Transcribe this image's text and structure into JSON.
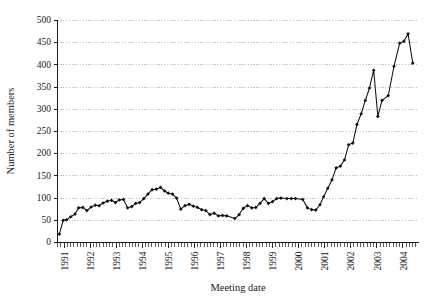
{
  "chart_data": {
    "type": "line",
    "title": "",
    "xlabel": "Meeting date",
    "ylabel": "Number of members",
    "ylim": [
      0,
      500
    ],
    "ytick_step": 50,
    "yticks": [
      0,
      50,
      100,
      150,
      200,
      250,
      300,
      350,
      400,
      450,
      500
    ],
    "xticks": [
      "1991",
      "1992",
      "1993",
      "1994",
      "1995",
      "1996",
      "1997",
      "1998",
      "1999",
      "2000",
      "2001",
      "2002",
      "2003",
      "2004"
    ],
    "xlim": [
      1990.75,
      2004.6
    ],
    "grid": "horizontal",
    "legend": "none",
    "marker": "filled-diamond",
    "line_color": "#111111",
    "marker_color": "#111111",
    "grid_color": "#9a9a9a",
    "series": [
      {
        "name": "Number of members",
        "x": [
          1990.82,
          1990.97,
          1991.1,
          1991.26,
          1991.42,
          1991.56,
          1991.72,
          1991.88,
          1992.04,
          1992.2,
          1992.35,
          1992.5,
          1992.66,
          1992.82,
          1992.97,
          1993.12,
          1993.28,
          1993.44,
          1993.6,
          1993.75,
          1993.9,
          1994.06,
          1994.22,
          1994.38,
          1994.54,
          1994.7,
          1994.86,
          1995.0,
          1995.16,
          1995.32,
          1995.48,
          1995.64,
          1995.8,
          1995.96,
          1996.12,
          1996.28,
          1996.44,
          1996.6,
          1996.76,
          1996.92,
          1997.08,
          1997.24,
          1997.55,
          1997.72,
          1997.88,
          1998.04,
          1998.2,
          1998.36,
          1998.52,
          1998.68,
          1998.84,
          1999.0,
          1999.16,
          1999.32,
          1999.55,
          1999.72,
          1999.88,
          2000.16,
          2000.34,
          2000.5,
          2000.66,
          2000.82,
          2000.96,
          2001.12,
          2001.28,
          2001.44,
          2001.6,
          2001.76,
          2001.92,
          2002.08,
          2002.24,
          2002.4,
          2002.56,
          2002.72,
          2002.88,
          2003.04,
          2003.2,
          2003.44,
          2003.66,
          2003.88,
          2004.04,
          2004.2,
          2004.38
        ],
        "values": [
          19,
          50,
          51,
          58,
          64,
          78,
          79,
          72,
          80,
          84,
          83,
          89,
          93,
          95,
          90,
          96,
          97,
          78,
          81,
          88,
          90,
          99,
          109,
          119,
          120,
          124,
          116,
          111,
          109,
          100,
          75,
          83,
          86,
          82,
          79,
          74,
          72,
          63,
          66,
          60,
          61,
          60,
          54,
          63,
          77,
          83,
          78,
          79,
          88,
          99,
          88,
          92,
          99,
          100,
          99,
          99,
          99,
          97,
          78,
          74,
          73,
          85,
          103,
          122,
          141,
          168,
          172,
          186,
          220,
          224,
          266,
          290,
          320,
          348,
          388,
          284,
          320,
          331,
          397,
          449,
          453,
          470,
          404
        ]
      }
    ]
  },
  "axis": {
    "ylabel_text": "Number of members",
    "xlabel_text": "Meeting date"
  }
}
